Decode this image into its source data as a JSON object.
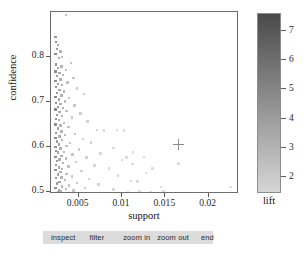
{
  "chart_data": {
    "type": "scatter",
    "title": "",
    "xlabel": "support",
    "ylabel": "confidence",
    "legend_title": "lift",
    "xlim": [
      0.0018,
      0.0235
    ],
    "ylim": [
      0.495,
      0.9
    ],
    "xticks": [
      "0.005",
      "0.01",
      "0.015",
      "0.02"
    ],
    "xtick_values": [
      0.005,
      0.01,
      0.015,
      0.02
    ],
    "yticks": [
      "0.5",
      "0.6",
      "0.7",
      "0.8"
    ],
    "ytick_values": [
      0.5,
      0.6,
      0.7,
      0.8
    ],
    "grid": false,
    "legend_position": "right",
    "colorscale": {
      "name": "grayscale",
      "high_color": "#4a4a4a",
      "low_color": "#d6d6d6",
      "ticks": [
        "7",
        "6",
        "5",
        "4",
        "3",
        "2"
      ],
      "tick_values": [
        7,
        6,
        5,
        4,
        3,
        2
      ],
      "range": [
        1.4,
        7.6
      ]
    },
    "marker": {
      "shape": "square",
      "size_px": 2.4,
      "opacity": 0.75
    },
    "cursor_marker": {
      "shape": "plus",
      "x": 0.0165,
      "y": 0.607
    },
    "series": [
      {
        "name": "rules",
        "color_by": "lift",
        "points": [
          [
            0.0035,
            0.893,
            3.2
          ],
          [
            0.0023,
            0.845,
            5.6
          ],
          [
            0.0024,
            0.833,
            6.0
          ],
          [
            0.0026,
            0.826,
            4.4
          ],
          [
            0.0025,
            0.818,
            5.1
          ],
          [
            0.0029,
            0.812,
            4.0
          ],
          [
            0.0023,
            0.806,
            6.4
          ],
          [
            0.0031,
            0.8,
            3.6
          ],
          [
            0.0027,
            0.797,
            4.6
          ],
          [
            0.0041,
            0.786,
            3.0
          ],
          [
            0.0024,
            0.783,
            5.8
          ],
          [
            0.003,
            0.779,
            4.1
          ],
          [
            0.0026,
            0.775,
            5.0
          ],
          [
            0.0035,
            0.771,
            3.4
          ],
          [
            0.0023,
            0.768,
            6.2
          ],
          [
            0.0028,
            0.764,
            4.5
          ],
          [
            0.0032,
            0.76,
            3.8
          ],
          [
            0.0025,
            0.757,
            5.3
          ],
          [
            0.0044,
            0.753,
            2.9
          ],
          [
            0.0029,
            0.75,
            4.3
          ],
          [
            0.0023,
            0.747,
            6.1
          ],
          [
            0.0037,
            0.743,
            3.3
          ],
          [
            0.0026,
            0.74,
            5.2
          ],
          [
            0.0031,
            0.737,
            4.0
          ],
          [
            0.0024,
            0.733,
            5.7
          ],
          [
            0.0048,
            0.73,
            2.7
          ],
          [
            0.0028,
            0.727,
            4.7
          ],
          [
            0.0033,
            0.723,
            3.7
          ],
          [
            0.0025,
            0.72,
            5.4
          ],
          [
            0.0056,
            0.717,
            2.4
          ],
          [
            0.003,
            0.714,
            4.2
          ],
          [
            0.0023,
            0.711,
            6.3
          ],
          [
            0.0039,
            0.708,
            3.1
          ],
          [
            0.0027,
            0.705,
            4.9
          ],
          [
            0.0034,
            0.701,
            3.6
          ],
          [
            0.0024,
            0.698,
            5.9
          ],
          [
            0.0029,
            0.695,
            4.4
          ],
          [
            0.0045,
            0.692,
            2.8
          ],
          [
            0.0026,
            0.689,
            5.1
          ],
          [
            0.0032,
            0.686,
            3.9
          ],
          [
            0.0023,
            0.683,
            6.5
          ],
          [
            0.0036,
            0.68,
            3.4
          ],
          [
            0.0028,
            0.677,
            4.6
          ],
          [
            0.0052,
            0.674,
            2.5
          ],
          [
            0.0025,
            0.671,
            5.4
          ],
          [
            0.0031,
            0.668,
            4.0
          ],
          [
            0.0042,
            0.665,
            3.0
          ],
          [
            0.0024,
            0.662,
            5.8
          ],
          [
            0.0027,
            0.659,
            4.8
          ],
          [
            0.006,
            0.656,
            2.3
          ],
          [
            0.0033,
            0.653,
            3.7
          ],
          [
            0.0023,
            0.65,
            6.2
          ],
          [
            0.0029,
            0.647,
            4.3
          ],
          [
            0.0038,
            0.644,
            3.2
          ],
          [
            0.0026,
            0.641,
            5.0
          ],
          [
            0.0071,
            0.638,
            2.0
          ],
          [
            0.0079,
            0.636,
            1.9
          ],
          [
            0.003,
            0.634,
            4.1
          ],
          [
            0.0024,
            0.631,
            5.6
          ],
          [
            0.0046,
            0.628,
            2.8
          ],
          [
            0.0034,
            0.626,
            3.5
          ],
          [
            0.0028,
            0.623,
            4.5
          ],
          [
            0.0023,
            0.62,
            6.4
          ],
          [
            0.0055,
            0.617,
            2.4
          ],
          [
            0.0031,
            0.615,
            3.9
          ],
          [
            0.0025,
            0.612,
            5.3
          ],
          [
            0.0064,
            0.61,
            2.2
          ],
          [
            0.004,
            0.608,
            3.1
          ],
          [
            0.0027,
            0.605,
            4.7
          ],
          [
            0.0036,
            0.602,
            3.4
          ],
          [
            0.0023,
            0.6,
            6.1
          ],
          [
            0.009,
            0.598,
            1.8
          ],
          [
            0.0029,
            0.596,
            4.3
          ],
          [
            0.005,
            0.594,
            2.6
          ],
          [
            0.0024,
            0.591,
            5.7
          ],
          [
            0.0033,
            0.589,
            3.6
          ],
          [
            0.0026,
            0.587,
            5.0
          ],
          [
            0.0075,
            0.585,
            1.9
          ],
          [
            0.0043,
            0.583,
            2.9
          ],
          [
            0.003,
            0.58,
            4.1
          ],
          [
            0.0023,
            0.578,
            6.3
          ],
          [
            0.0059,
            0.576,
            2.3
          ],
          [
            0.0035,
            0.574,
            3.4
          ],
          [
            0.0028,
            0.572,
            4.5
          ],
          [
            0.01,
            0.57,
            1.7
          ],
          [
            0.0025,
            0.568,
            5.2
          ],
          [
            0.0047,
            0.566,
            2.7
          ],
          [
            0.0032,
            0.564,
            3.8
          ],
          [
            0.0112,
            0.562,
            1.6
          ],
          [
            0.0024,
            0.56,
            5.6
          ],
          [
            0.0068,
            0.558,
            2.1
          ],
          [
            0.0038,
            0.556,
            3.2
          ],
          [
            0.0027,
            0.554,
            4.7
          ],
          [
            0.0085,
            0.552,
            1.8
          ],
          [
            0.0031,
            0.55,
            3.9
          ],
          [
            0.0023,
            0.548,
            6.0
          ],
          [
            0.0053,
            0.546,
            2.5
          ],
          [
            0.0029,
            0.544,
            4.3
          ],
          [
            0.0128,
            0.542,
            1.5
          ],
          [
            0.0036,
            0.54,
            3.3
          ],
          [
            0.0026,
            0.538,
            5.0
          ],
          [
            0.0095,
            0.536,
            1.7
          ],
          [
            0.0042,
            0.534,
            3.0
          ],
          [
            0.003,
            0.532,
            4.0
          ],
          [
            0.0024,
            0.53,
            5.7
          ],
          [
            0.0062,
            0.528,
            2.2
          ],
          [
            0.0034,
            0.526,
            3.5
          ],
          [
            0.011,
            0.524,
            1.6
          ],
          [
            0.0028,
            0.522,
            4.5
          ],
          [
            0.0048,
            0.52,
            2.7
          ],
          [
            0.0025,
            0.518,
            5.3
          ],
          [
            0.0073,
            0.516,
            2.0
          ],
          [
            0.0039,
            0.514,
            3.1
          ],
          [
            0.0031,
            0.512,
            3.8
          ],
          [
            0.0145,
            0.511,
            1.5
          ],
          [
            0.0023,
            0.509,
            6.2
          ],
          [
            0.0057,
            0.508,
            2.4
          ],
          [
            0.0035,
            0.506,
            3.4
          ],
          [
            0.009,
            0.505,
            1.8
          ],
          [
            0.0027,
            0.504,
            4.6
          ],
          [
            0.0044,
            0.503,
            2.9
          ],
          [
            0.0029,
            0.502,
            4.2
          ],
          [
            0.012,
            0.501,
            1.6
          ],
          [
            0.0026,
            0.5,
            5.1
          ],
          [
            0.0225,
            0.511,
            1.4
          ],
          [
            0.0165,
            0.563,
            1.5
          ],
          [
            0.0135,
            0.552,
            1.5
          ],
          [
            0.0148,
            0.501,
            1.5
          ],
          [
            0.0125,
            0.578,
            1.6
          ],
          [
            0.0118,
            0.523,
            1.6
          ],
          [
            0.0107,
            0.5,
            1.7
          ],
          [
            0.0133,
            0.5,
            1.5
          ],
          [
            0.0102,
            0.636,
            1.7
          ],
          [
            0.0094,
            0.637,
            1.8
          ],
          [
            0.0113,
            0.587,
            1.6
          ],
          [
            0.0105,
            0.576,
            1.7
          ]
        ]
      }
    ]
  },
  "buttons": {
    "inspect": "inspect",
    "filter": "filter",
    "zoom_in": "zoom in",
    "zoom_out": "zoom out",
    "end": "end"
  }
}
